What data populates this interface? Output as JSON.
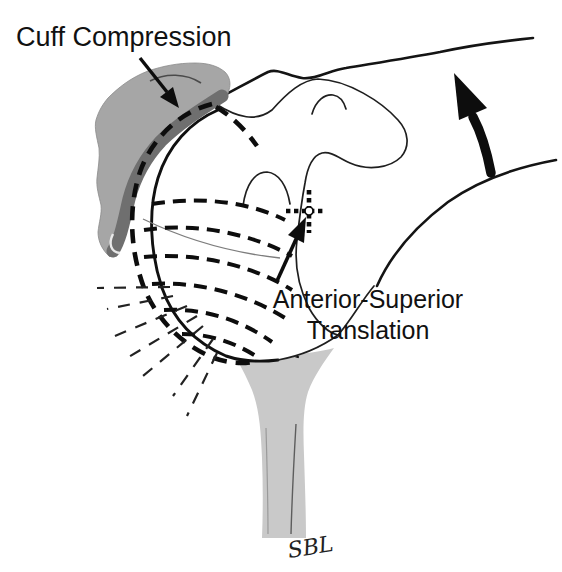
{
  "figure": {
    "title_region": {
      "cuff_compression_label": "Cuff Compression"
    },
    "annotation_region": {
      "translation_label_line1": "Anterior-Superior",
      "translation_label_line2": "Translation"
    },
    "signature": "SBL",
    "colors": {
      "background": "#ffffff",
      "line": "#1a1a1a",
      "cuff_gray": "#a6a6a6",
      "cuff_edge_gray": "#6f6f6f",
      "bone_gray": "#c9c9c9"
    }
  }
}
